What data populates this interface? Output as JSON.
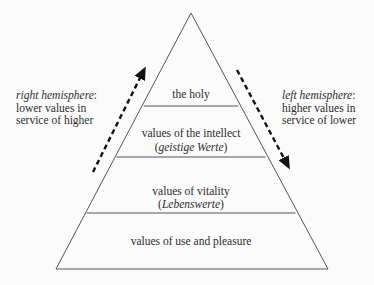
{
  "diagram": {
    "type": "pyramid",
    "colors": {
      "background": "#fbfbfb",
      "outline": "#555555",
      "arrow": "#111111",
      "text": "#2b2b2b"
    },
    "levels": [
      {
        "label": "the holy",
        "sublabel": null
      },
      {
        "label": "values of the intellect",
        "sublabel_open": "(",
        "sublabel": "geistige Werte",
        "sublabel_close": ")"
      },
      {
        "label": "values of vitality",
        "sublabel_open": "(",
        "sublabel": "Lebenswerte",
        "sublabel_close": ")"
      },
      {
        "label": "values of use and pleasure",
        "sublabel": null
      }
    ],
    "left_annotation": {
      "title": "right hemisphere",
      "title_suffix": ":",
      "line2": "lower values in",
      "line3": "service of higher",
      "arrow_direction": "up"
    },
    "right_annotation": {
      "title": "left hemisphere",
      "title_suffix": ":",
      "line2": "higher values in",
      "line3": "service of lower",
      "arrow_direction": "down"
    }
  }
}
